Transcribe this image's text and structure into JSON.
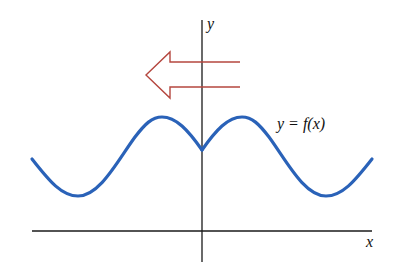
{
  "figure": {
    "axes": {
      "x_label": "x",
      "y_label": "y",
      "axis_color": "#1a1a1a"
    },
    "curve": {
      "label": "y = f(x)",
      "color": "#2a62b8",
      "shape": "wave with minima near far left/right, maxima on either side of the y-axis, cusp (local min) at x = 0"
    },
    "arrow": {
      "direction": "left",
      "style": "hollow outline",
      "color": "#b5473f"
    }
  }
}
